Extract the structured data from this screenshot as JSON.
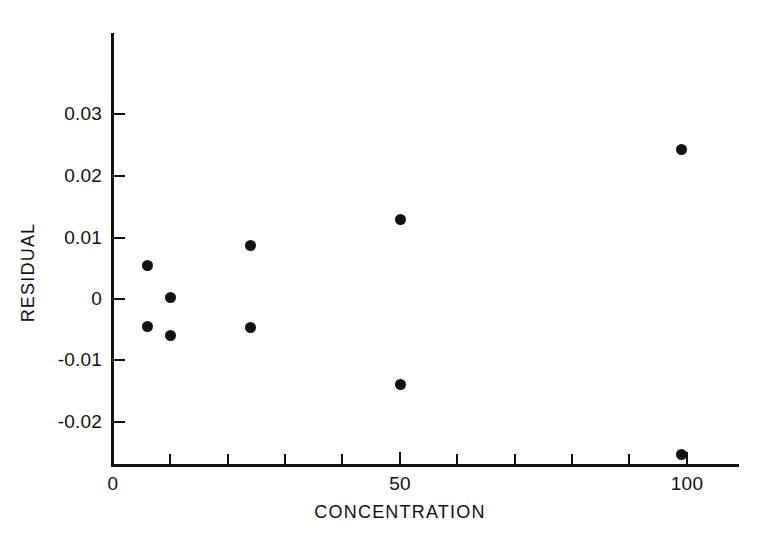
{
  "chart_data": {
    "type": "scatter",
    "title": "",
    "xlabel": "CONCENTRATION",
    "ylabel": "RESIDUAL",
    "xlim": [
      0,
      109
    ],
    "ylim": [
      -0.0265,
      0.0345
    ],
    "grid": false,
    "legend": null,
    "x_major_ticks": [
      0,
      50,
      100
    ],
    "x_major_tick_labels": [
      "0",
      "50",
      "100"
    ],
    "x_minor_ticks": [
      10,
      20,
      30,
      40,
      60,
      70,
      80,
      90
    ],
    "y_ticks": [
      0.03,
      0.02,
      0.01,
      0,
      -0.01,
      -0.02
    ],
    "y_tick_labels": [
      "0.03",
      "0.02",
      "0.01",
      "0",
      "-0.01",
      "-0.02"
    ],
    "marker": "filled-circle",
    "marker_color": "#121212",
    "points": [
      {
        "x": 6,
        "y": 0.0055
      },
      {
        "x": 10,
        "y": 0.0003
      },
      {
        "x": 6,
        "y": -0.0045
      },
      {
        "x": 10,
        "y": -0.006
      },
      {
        "x": 24,
        "y": 0.0088
      },
      {
        "x": 24,
        "y": -0.0047
      },
      {
        "x": 50,
        "y": 0.013
      },
      {
        "x": 50,
        "y": -0.014
      },
      {
        "x": 99,
        "y": 0.0245
      },
      {
        "x": 99,
        "y": -0.0255
      }
    ]
  },
  "axes": {
    "x_title": "CONCENTRATION",
    "y_title": "RESIDUAL",
    "x_labels": [
      "0",
      "50",
      "100"
    ],
    "y_labels": [
      "0.03",
      "0.02",
      "0.01",
      "0",
      "-0.01",
      "-0.02"
    ]
  },
  "colors": {
    "marker": "#121212",
    "axis": "#111111",
    "background": "#ffffff"
  }
}
